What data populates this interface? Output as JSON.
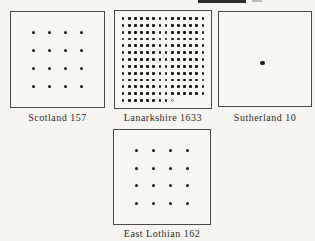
{
  "figure": {
    "background": "#f6f5f1",
    "ink": "#1a1a1a",
    "box_border": "#4a4a4a",
    "dot_unit": 10
  },
  "panels": [
    {
      "id": "scotland",
      "region": "Scotland",
      "value": 157,
      "label": "Scotland 157",
      "dots": {
        "type": "grid",
        "rows": 4,
        "cols": 4,
        "count": 16
      }
    },
    {
      "id": "lanarkshire",
      "region": "Lanarkshire",
      "value": 1633,
      "label": "Lanarkshire 1633",
      "dots": {
        "type": "dense",
        "cols": 14,
        "full_rows": 12,
        "last_row_solid": 8,
        "last_row_open": 1
      }
    },
    {
      "id": "sutherland",
      "region": "Sutherland",
      "value": 10,
      "label": "Sutherland 10",
      "dots": {
        "type": "single",
        "count": 1
      }
    },
    {
      "id": "east-lothian",
      "region": "East Lothian",
      "value": 162,
      "label": "East Lothian 162",
      "dots": {
        "type": "grid",
        "rows": 4,
        "cols": 4,
        "count": 16
      }
    }
  ],
  "chart_data": {
    "type": "table",
    "categories": [
      "Scotland",
      "Lanarkshire",
      "Sutherland",
      "East Lothian"
    ],
    "values": [
      157,
      1633,
      10,
      162
    ],
    "representation": "dot-unit pictogram; each dot represents approximately 10 units",
    "panel_captions": [
      "Scotland 157",
      "Lanarkshire 1633",
      "Sutherland 10",
      "East Lothian 162"
    ]
  }
}
